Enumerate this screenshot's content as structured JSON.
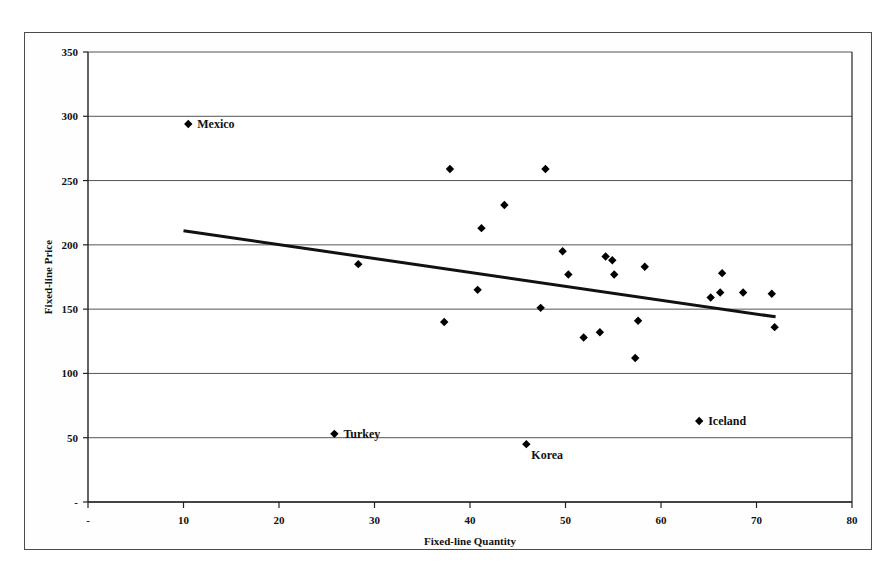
{
  "chart_data": {
    "type": "scatter",
    "title": "",
    "xlabel": "Fixed-line Quantity",
    "ylabel": "Fixed-line Price",
    "xlim": [
      0,
      80
    ],
    "ylim": [
      0,
      350
    ],
    "xticks": [
      "-",
      "10",
      "20",
      "30",
      "40",
      "50",
      "60",
      "70",
      "80"
    ],
    "xtick_values": [
      0,
      10,
      20,
      30,
      40,
      50,
      60,
      70,
      80
    ],
    "yticks": [
      "-",
      "50",
      "100",
      "150",
      "200",
      "250",
      "300",
      "350"
    ],
    "ytick_values": [
      0,
      50,
      100,
      150,
      200,
      250,
      300,
      350
    ],
    "grid": "horizontal",
    "legend": "none",
    "marker": "diamond",
    "marker_color": "#000000",
    "points": [
      {
        "x": 10.5,
        "y": 294,
        "label": "Mexico",
        "label_pos": "right"
      },
      {
        "x": 25.8,
        "y": 53,
        "label": "Turkey",
        "label_pos": "right"
      },
      {
        "x": 28.3,
        "y": 185,
        "label": "",
        "label_pos": ""
      },
      {
        "x": 37.3,
        "y": 140,
        "label": "",
        "label_pos": ""
      },
      {
        "x": 37.9,
        "y": 259,
        "label": "",
        "label_pos": ""
      },
      {
        "x": 40.8,
        "y": 165,
        "label": "",
        "label_pos": ""
      },
      {
        "x": 41.2,
        "y": 213,
        "label": "",
        "label_pos": ""
      },
      {
        "x": 43.6,
        "y": 231,
        "label": "",
        "label_pos": ""
      },
      {
        "x": 45.9,
        "y": 45,
        "label": "Korea",
        "label_pos": "below-right"
      },
      {
        "x": 47.4,
        "y": 151,
        "label": "",
        "label_pos": ""
      },
      {
        "x": 47.9,
        "y": 259,
        "label": "",
        "label_pos": ""
      },
      {
        "x": 49.7,
        "y": 195,
        "label": "",
        "label_pos": ""
      },
      {
        "x": 50.3,
        "y": 177,
        "label": "",
        "label_pos": ""
      },
      {
        "x": 51.9,
        "y": 128,
        "label": "",
        "label_pos": ""
      },
      {
        "x": 53.6,
        "y": 132,
        "label": "",
        "label_pos": ""
      },
      {
        "x": 54.2,
        "y": 191,
        "label": "",
        "label_pos": ""
      },
      {
        "x": 54.9,
        "y": 188,
        "label": "",
        "label_pos": ""
      },
      {
        "x": 55.1,
        "y": 177,
        "label": "",
        "label_pos": ""
      },
      {
        "x": 57.3,
        "y": 112,
        "label": "",
        "label_pos": ""
      },
      {
        "x": 57.6,
        "y": 141,
        "label": "",
        "label_pos": ""
      },
      {
        "x": 58.3,
        "y": 183,
        "label": "",
        "label_pos": ""
      },
      {
        "x": 64.0,
        "y": 63,
        "label": "Iceland",
        "label_pos": "right"
      },
      {
        "x": 65.2,
        "y": 159,
        "label": "",
        "label_pos": ""
      },
      {
        "x": 66.2,
        "y": 163,
        "label": "",
        "label_pos": ""
      },
      {
        "x": 66.4,
        "y": 178,
        "label": "",
        "label_pos": ""
      },
      {
        "x": 68.6,
        "y": 163,
        "label": "",
        "label_pos": ""
      },
      {
        "x": 71.6,
        "y": 162,
        "label": "",
        "label_pos": ""
      },
      {
        "x": 71.9,
        "y": 136,
        "label": "",
        "label_pos": ""
      }
    ],
    "trendline": {
      "type": "linear",
      "x_start": 10.0,
      "y_start": 211,
      "x_end": 72.0,
      "y_end": 144,
      "color": "#111111",
      "width": 3
    }
  },
  "axes": {
    "x_title": "Fixed-line Quantity",
    "y_title": "Fixed-line Price"
  },
  "labels": {
    "mexico": "Mexico",
    "turkey": "Turkey",
    "korea": "Korea",
    "iceland": "Iceland"
  },
  "colors": {
    "marker": "#000000",
    "trendline": "#111111",
    "gridline": "#555555",
    "axis": "#222222",
    "frame": "#4a4a4a",
    "background": "#ffffff"
  }
}
